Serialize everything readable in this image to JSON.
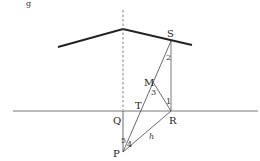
{
  "figure": {
    "corner_label": "g",
    "points": {
      "S": "S",
      "M": "M",
      "T": "T",
      "Q": "Q",
      "R": "R",
      "P": "P"
    },
    "angles": {
      "a1": "1",
      "a2": "2",
      "a3": "3",
      "a4": "4",
      "a5": "5"
    },
    "segment_label": "h"
  }
}
